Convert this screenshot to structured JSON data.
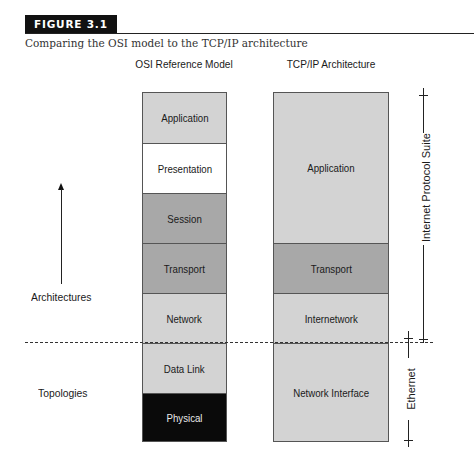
{
  "figure": {
    "label": "FIGURE 3.1",
    "caption": "Comparing the OSI model to the TCP/IP architecture"
  },
  "osi": {
    "title": "OSI Reference Model",
    "layers": [
      {
        "label": "Application",
        "fill": "#d3d3d3",
        "text_color": "#1a1a1a"
      },
      {
        "label": "Presentation",
        "fill": "#ffffff",
        "text_color": "#1a1a1a"
      },
      {
        "label": "Session",
        "fill": "#a8a8a8",
        "text_color": "#1a1a1a"
      },
      {
        "label": "Transport",
        "fill": "#a8a8a8",
        "text_color": "#1a1a1a"
      },
      {
        "label": "Network",
        "fill": "#d3d3d3",
        "text_color": "#1a1a1a"
      },
      {
        "label": "Data Link",
        "fill": "#d3d3d3",
        "text_color": "#1a1a1a"
      },
      {
        "label": "Physical",
        "fill": "#0a0a0a",
        "text_color": "#e8e8e8"
      }
    ]
  },
  "tcpip": {
    "title": "TCP/IP Architecture",
    "layers": [
      {
        "label": "Application",
        "fill": "#d3d3d3",
        "spans_osi_layers": 3
      },
      {
        "label": "Transport",
        "fill": "#a8a8a8",
        "spans_osi_layers": 1
      },
      {
        "label": "Internetwork",
        "fill": "#d3d3d3",
        "spans_osi_layers": 1
      },
      {
        "label": "Network Interface",
        "fill": "#d3d3d3",
        "spans_osi_layers": 2
      }
    ]
  },
  "side_labels": {
    "upper": "Architectures",
    "lower": "Topologies"
  },
  "brackets": {
    "internet_protocol_suite": "Internet Protocol Suite",
    "ethernet": "Ethernet"
  }
}
